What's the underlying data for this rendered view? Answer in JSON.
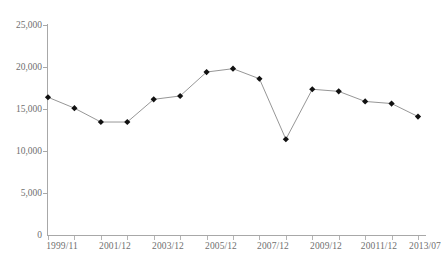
{
  "chart_data": {
    "type": "line",
    "title": "",
    "subtitle": "",
    "xlabel": "",
    "ylabel": "",
    "ylim": [
      0,
      25000
    ],
    "ytick_labels": [
      "0",
      "5,000",
      "10,000",
      "15,000",
      "20,000",
      "25,000"
    ],
    "ytick_values": [
      0,
      5000,
      10000,
      15000,
      20000,
      25000
    ],
    "grid": false,
    "legend": false,
    "legend_position": "none",
    "xtick_labels": [
      "1999/11",
      "2001/12",
      "2003/12",
      "2005/12",
      "2007/12",
      "2009/12",
      "20011/12",
      "2013/07"
    ],
    "categories": [
      "1999/11",
      "2000/12",
      "2001/12",
      "2002/12",
      "2003/12",
      "2004/12",
      "2005/12",
      "2006/12",
      "2007/12",
      "2008/12",
      "2009/12",
      "2010/12",
      "20011/12",
      "2012/12",
      "2013/07"
    ],
    "series": [
      {
        "name": "series-1",
        "color": "#8a8a8a",
        "marker_color": "#111111",
        "values": [
          16400,
          15100,
          13450,
          13450,
          16150,
          16550,
          19400,
          19800,
          18600,
          11400,
          17350,
          17100,
          15900,
          15650,
          14100
        ]
      }
    ]
  },
  "axis": {
    "line_color": "#a8a8a8",
    "tick_color": "#b4b4b4",
    "label_color": "#6f6f6f"
  }
}
